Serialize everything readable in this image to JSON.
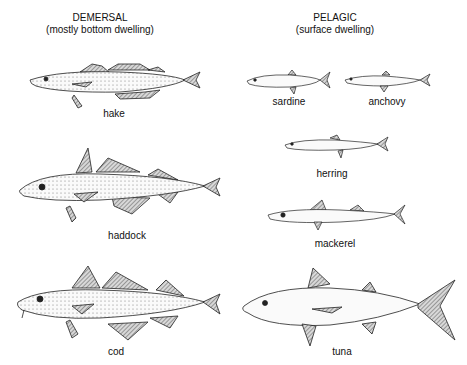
{
  "columns": [
    {
      "title": "DEMERSAL",
      "subtitle": "(mostly bottom dwelling)",
      "fish": [
        {
          "name": "hake"
        },
        {
          "name": "haddock"
        },
        {
          "name": "cod"
        }
      ]
    },
    {
      "title": "PELAGIC",
      "subtitle": "(surface dwelling)",
      "fish": [
        {
          "name": "sardine"
        },
        {
          "name": "anchovy"
        },
        {
          "name": "herring"
        },
        {
          "name": "mackerel"
        },
        {
          "name": "tuna"
        }
      ]
    }
  ],
  "colors": {
    "ink": "#222222",
    "fin": "#9a9a9a",
    "body": "#f4f4f4"
  }
}
